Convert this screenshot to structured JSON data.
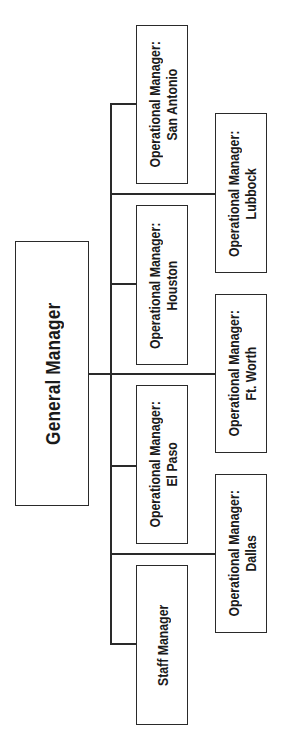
{
  "diagram": {
    "type": "org-chart",
    "orientation": "rotated-90-ccw",
    "line_color": "#2a2a2a",
    "root": {
      "title": "General Manager"
    },
    "direct_reports": [
      {
        "id": "san-antonio",
        "line1": "Operational Manager:",
        "line2": "San Antonio",
        "column": "inner"
      },
      {
        "id": "lubbock",
        "line1": "Operational Manager:",
        "line2": "Lubbock",
        "column": "outer"
      },
      {
        "id": "houston",
        "line1": "Operational Manager:",
        "line2": "Houston",
        "column": "inner"
      },
      {
        "id": "ft-worth",
        "line1": "Operational Manager:",
        "line2": "Ft. Worth",
        "column": "outer"
      },
      {
        "id": "el-paso",
        "line1": "Operational Manager:",
        "line2": "El Paso",
        "column": "inner"
      },
      {
        "id": "dallas",
        "line1": "Operational Manager:",
        "line2": "Dallas",
        "column": "outer"
      },
      {
        "id": "staff",
        "line1": "Staff Manager",
        "line2": "",
        "column": "inner"
      }
    ]
  }
}
